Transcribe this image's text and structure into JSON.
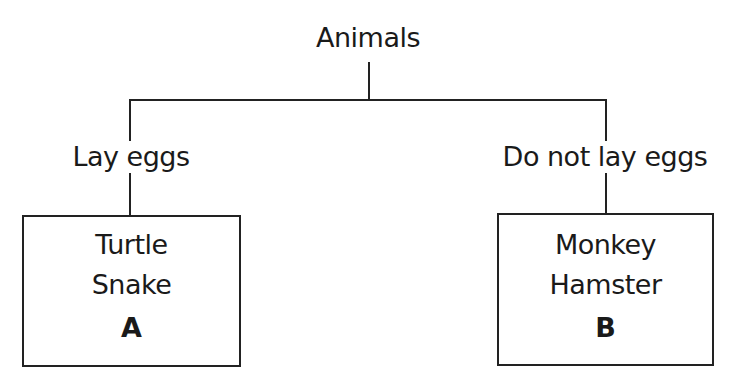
{
  "diagram": {
    "type": "classification tree",
    "root": {
      "label": "Animals"
    },
    "branches": [
      {
        "label": "Lay eggs",
        "box": {
          "items": [
            "Turtle",
            "Snake"
          ],
          "tag": "A"
        }
      },
      {
        "label": "Do not lay eggs",
        "box": {
          "items": [
            "Monkey",
            "Hamster"
          ],
          "tag": "B"
        }
      }
    ]
  },
  "colors": {
    "line": "#222222",
    "text": "#1a1a1a",
    "background": "#ffffff"
  }
}
